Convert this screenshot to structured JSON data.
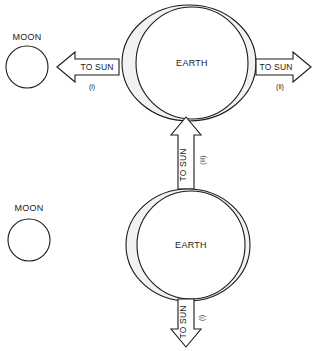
{
  "diagram": {
    "colors": {
      "stroke": "#1a1a1a",
      "bulge_fill": "#f2f2f2",
      "globe_fill": "#ffffff",
      "background": "#ffffff"
    },
    "scenes": [
      {
        "id": "top-scene",
        "moon": {
          "label": "MOON"
        },
        "earth": {
          "label": "EARTH"
        },
        "arrows": [
          {
            "id": "left-arrow",
            "label": "TO SUN",
            "roman": "(i)",
            "direction": "left"
          },
          {
            "id": "right-arrow",
            "label": "TO SUN",
            "roman": "(ii)",
            "direction": "right"
          }
        ]
      },
      {
        "id": "bottom-scene",
        "moon": {
          "label": "MOON"
        },
        "earth": {
          "label": "EARTH"
        },
        "arrows": [
          {
            "id": "up-arrow",
            "label": "TO SUN",
            "roman": "(iii)",
            "direction": "up"
          },
          {
            "id": "down-arrow",
            "label": "TO SUN",
            "roman": "(i)",
            "direction": "down"
          }
        ]
      }
    ]
  }
}
